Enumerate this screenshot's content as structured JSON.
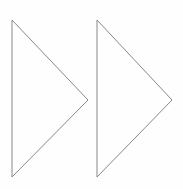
{
  "canvas": {
    "width": 183,
    "height": 189,
    "background_color": "#fefefe",
    "title": "Double right-pointing triangle outlines"
  },
  "style": {
    "stroke_color": "#888888",
    "stroke_width": 1,
    "fill": "none"
  },
  "shapes": [
    {
      "name": "triangle-left",
      "label": "Left right-pointing triangle",
      "points": "12,20 88,100 12,177",
      "vertices": [
        {
          "x": 12,
          "y": 20
        },
        {
          "x": 88,
          "y": 100
        },
        {
          "x": 12,
          "y": 177
        }
      ]
    },
    {
      "name": "triangle-right",
      "label": "Right right-pointing triangle",
      "points": "97,20 172,100 97,177",
      "vertices": [
        {
          "x": 97,
          "y": 20
        },
        {
          "x": 172,
          "y": 100
        },
        {
          "x": 97,
          "y": 177
        }
      ]
    }
  ],
  "accessibility": {
    "description": "Two identical unfilled triangles pointing to the right, drawn with thin gray outlines on a white background, resembling a fast-forward symbol."
  }
}
